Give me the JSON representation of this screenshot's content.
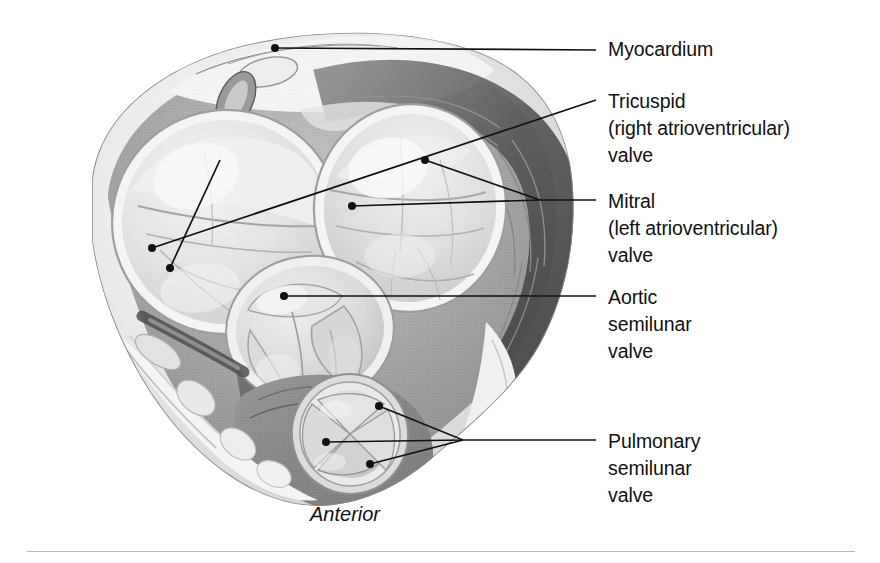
{
  "figure": {
    "kind": "anatomical-illustration",
    "orientation_caption": "Anterior",
    "background_color": "#ffffff",
    "ink_color": "#111111",
    "rule_color": "#b9b9b9"
  },
  "labels": [
    {
      "id": "myocardium",
      "lines": [
        "Myocardium"
      ],
      "text_x": 608,
      "text_top": 36,
      "leader_end_x": 596,
      "leader_y": 50
    },
    {
      "id": "tricuspid",
      "lines": [
        "Tricuspid",
        "(right atrioventricular)",
        "valve"
      ],
      "text_x": 608,
      "text_top": 88,
      "leader_end_x": 596,
      "leader_y": 100
    },
    {
      "id": "mitral",
      "lines": [
        "Mitral",
        "(left atrioventricular)",
        "valve"
      ],
      "text_x": 608,
      "text_top": 188,
      "leader_end_x": 596,
      "leader_y": 200
    },
    {
      "id": "aortic",
      "lines": [
        "Aortic",
        "semilunar",
        "valve"
      ],
      "text_x": 608,
      "text_top": 284,
      "leader_end_x": 596,
      "leader_y": 296
    },
    {
      "id": "pulmonary",
      "lines": [
        "Pulmonary",
        "semilunar",
        "valve"
      ],
      "text_x": 608,
      "text_top": 428,
      "leader_end_x": 596,
      "leader_y": 440
    }
  ],
  "caption": {
    "text": "Anterior",
    "x": 310,
    "top": 503
  },
  "leaders": {
    "myocardium": {
      "points": "275,48 596,50",
      "dots": [
        [
          275,
          48
        ]
      ]
    },
    "tricuspid": {
      "points": "596,100 152,248",
      "dots": [
        [
          152,
          248
        ]
      ]
    },
    "mitral_upper": {
      "points": "596,200 540,200 425,160",
      "dots": [
        [
          425,
          160
        ]
      ]
    },
    "mitral_lower": {
      "points": "596,200 540,200 352,206",
      "dots": [
        [
          352,
          206
        ]
      ]
    },
    "tricuspid_second": {
      "points": "220,160 170,268",
      "dots": [
        [
          170,
          268
        ]
      ]
    },
    "aortic": {
      "points": "284,296 596,296",
      "dots": [
        [
          284,
          296
        ]
      ]
    },
    "pulm_a": {
      "points": "596,440 463,440 379,406",
      "dots": [
        [
          379,
          406
        ]
      ]
    },
    "pulm_b": {
      "points": "596,440 463,440 326,442",
      "dots": [
        [
          326,
          442
        ]
      ]
    },
    "pulm_c": {
      "points": "596,440 463,440 370,464",
      "dots": [
        [
          370,
          464
        ]
      ]
    }
  }
}
